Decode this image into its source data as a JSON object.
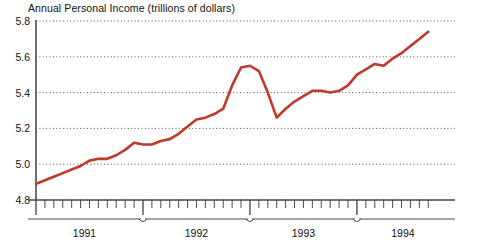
{
  "chart_data": {
    "type": "line",
    "title": "Annual Personal Income (trillions of dollars)",
    "xlabel": "",
    "ylabel": "",
    "ylim": [
      4.8,
      5.8
    ],
    "yticks": [
      4.8,
      5.0,
      5.2,
      5.4,
      5.6,
      5.8
    ],
    "ytick_labels": [
      "4.8",
      "5.0",
      "5.2",
      "5.4",
      "5.6",
      "5.8"
    ],
    "grid": true,
    "grid_style": "dotted",
    "legend": "none",
    "line_color": "#c0392b",
    "axis_color": "#4d4d4d",
    "x_axis_type": "monthly-ticks-with-year-brackets",
    "year_brackets": [
      "1991",
      "1992",
      "1993",
      "1994"
    ],
    "x_start": "1991-01",
    "x_end": "1994-09",
    "categories": [
      "1991-01",
      "1991-02",
      "1991-03",
      "1991-04",
      "1991-05",
      "1991-06",
      "1991-07",
      "1991-08",
      "1991-09",
      "1991-10",
      "1991-11",
      "1991-12",
      "1992-01",
      "1992-02",
      "1992-03",
      "1992-04",
      "1992-05",
      "1992-06",
      "1992-07",
      "1992-08",
      "1992-09",
      "1992-10",
      "1992-11",
      "1992-12",
      "1993-01",
      "1993-02",
      "1993-03",
      "1993-04",
      "1993-05",
      "1993-06",
      "1993-07",
      "1993-08",
      "1993-09",
      "1993-10",
      "1993-11",
      "1993-12",
      "1994-01",
      "1994-02",
      "1994-03",
      "1994-04",
      "1994-05",
      "1994-06",
      "1994-07",
      "1994-08",
      "1994-09"
    ],
    "values": [
      4.89,
      4.91,
      4.93,
      4.95,
      4.97,
      4.99,
      5.02,
      5.03,
      5.03,
      5.05,
      5.08,
      5.12,
      5.11,
      5.11,
      5.13,
      5.14,
      5.17,
      5.21,
      5.25,
      5.26,
      5.28,
      5.31,
      5.44,
      5.54,
      5.55,
      5.52,
      5.4,
      5.26,
      5.31,
      5.35,
      5.38,
      5.41,
      5.41,
      5.4,
      5.41,
      5.44,
      5.5,
      5.53,
      5.56,
      5.55,
      5.59,
      5.62,
      5.66,
      5.7,
      5.74
    ]
  }
}
